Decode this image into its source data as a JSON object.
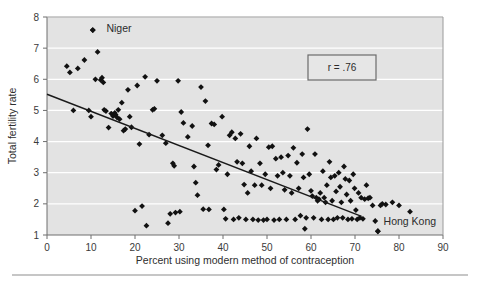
{
  "chart_data": {
    "type": "scatter",
    "title": "",
    "xlabel": "Percent using modern method of contraception",
    "ylabel": "Total fertility rate",
    "xlim": [
      0,
      90
    ],
    "ylim": [
      1,
      8
    ],
    "xticks": [
      "0",
      "10",
      "20",
      "30",
      "40",
      "50",
      "60",
      "70",
      "80",
      "90"
    ],
    "yticks": [
      "1",
      "2",
      "3",
      "4",
      "5",
      "6",
      "7",
      "8"
    ],
    "grid": true,
    "grid_color": "#ffffff",
    "plot_background": "#e3e3e3",
    "marker": "diamond",
    "marker_color": "#111111",
    "annotations": [
      {
        "name": "correlation-box",
        "text": "r = .76",
        "x": 52.5,
        "y": 6.45
      }
    ],
    "point_labels": [
      {
        "name": "niger-label",
        "text": "Niger",
        "x": 13.5,
        "y": 7.52
      },
      {
        "name": "hong-kong-label",
        "text": "Hong Kong",
        "x": 76.5,
        "y": 1.32
      }
    ],
    "trendline": {
      "name": "regression-line",
      "x0": 0,
      "y0": 5.52,
      "x1": 71.5,
      "y1": 1.6,
      "color": "#1a1a1a"
    },
    "points": [
      [
        4.5,
        6.42
      ],
      [
        5.2,
        6.22
      ],
      [
        6.0,
        5.0
      ],
      [
        7.0,
        6.35
      ],
      [
        8.5,
        6.62
      ],
      [
        9.5,
        5.0
      ],
      [
        10.0,
        4.8
      ],
      [
        10.4,
        7.58
      ],
      [
        11.0,
        6.0
      ],
      [
        11.5,
        6.88
      ],
      [
        12.2,
        5.98
      ],
      [
        12.5,
        6.05
      ],
      [
        12.8,
        5.9
      ],
      [
        13.0,
        5.02
      ],
      [
        13.4,
        4.98
      ],
      [
        14.0,
        4.45
      ],
      [
        14.6,
        4.9
      ],
      [
        15.0,
        4.82
      ],
      [
        15.4,
        4.92
      ],
      [
        15.6,
        4.86
      ],
      [
        15.9,
        4.78
      ],
      [
        16.2,
        5.02
      ],
      [
        16.5,
        4.72
      ],
      [
        17.0,
        5.25
      ],
      [
        17.4,
        4.35
      ],
      [
        17.8,
        4.4
      ],
      [
        18.4,
        5.66
      ],
      [
        18.8,
        4.8
      ],
      [
        19.2,
        4.46
      ],
      [
        20.0,
        1.78
      ],
      [
        20.5,
        5.8
      ],
      [
        21.0,
        3.92
      ],
      [
        21.6,
        1.93
      ],
      [
        22.3,
        6.08
      ],
      [
        22.6,
        1.3
      ],
      [
        23.2,
        4.22
      ],
      [
        24.0,
        5.02
      ],
      [
        24.4,
        5.05
      ],
      [
        25.0,
        5.95
      ],
      [
        26.2,
        4.2
      ],
      [
        27.5,
        1.38
      ],
      [
        28.0,
        1.68
      ],
      [
        28.6,
        3.3
      ],
      [
        28.9,
        3.22
      ],
      [
        29.2,
        1.72
      ],
      [
        29.8,
        5.95
      ],
      [
        30.2,
        1.75
      ],
      [
        31.0,
        4.6
      ],
      [
        32.0,
        4.15
      ],
      [
        33.0,
        4.5
      ],
      [
        33.4,
        3.2
      ],
      [
        33.8,
        2.68
      ],
      [
        34.2,
        2.28
      ],
      [
        35.0,
        5.75
      ],
      [
        35.5,
        1.83
      ],
      [
        36.0,
        5.3
      ],
      [
        36.6,
        3.88
      ],
      [
        37.4,
        4.58
      ],
      [
        38.0,
        4.55
      ],
      [
        38.5,
        3.1
      ],
      [
        39.0,
        3.25
      ],
      [
        39.8,
        4.8
      ],
      [
        40.2,
        1.82
      ],
      [
        40.6,
        1.52
      ],
      [
        41.0,
        2.95
      ],
      [
        41.5,
        4.2
      ],
      [
        42.0,
        4.3
      ],
      [
        42.4,
        1.5
      ],
      [
        42.8,
        4.1
      ],
      [
        43.2,
        3.35
      ],
      [
        43.6,
        1.55
      ],
      [
        44.0,
        4.25
      ],
      [
        44.4,
        3.3
      ],
      [
        44.8,
        2.62
      ],
      [
        45.2,
        1.5
      ],
      [
        45.6,
        2.35
      ],
      [
        46.0,
        3.85
      ],
      [
        46.4,
        3.05
      ],
      [
        46.8,
        1.5
      ],
      [
        47.2,
        2.6
      ],
      [
        47.6,
        4.1
      ],
      [
        48.0,
        1.48
      ],
      [
        48.4,
        3.3
      ],
      [
        48.8,
        2.6
      ],
      [
        49.2,
        1.48
      ],
      [
        49.6,
        2.95
      ],
      [
        50.0,
        1.5
      ],
      [
        50.4,
        3.82
      ],
      [
        50.8,
        2.5
      ],
      [
        51.2,
        3.85
      ],
      [
        51.6,
        1.48
      ],
      [
        52.0,
        3.45
      ],
      [
        52.4,
        2.9
      ],
      [
        52.8,
        1.5
      ],
      [
        53.2,
        3.5
      ],
      [
        53.6,
        3.0
      ],
      [
        54.0,
        2.45
      ],
      [
        54.4,
        1.5
      ],
      [
        54.8,
        3.55
      ],
      [
        55.2,
        2.9
      ],
      [
        55.6,
        2.35
      ],
      [
        56.0,
        3.8
      ],
      [
        56.4,
        1.5
      ],
      [
        56.8,
        3.32
      ],
      [
        57.2,
        2.5
      ],
      [
        57.6,
        1.62
      ],
      [
        58.0,
        3.6
      ],
      [
        58.3,
        2.85
      ],
      [
        58.6,
        1.2
      ],
      [
        58.9,
        1.55
      ],
      [
        59.2,
        4.4
      ],
      [
        59.6,
        2.95
      ],
      [
        60.0,
        2.42
      ],
      [
        60.3,
        2.25
      ],
      [
        60.6,
        1.55
      ],
      [
        60.9,
        3.6
      ],
      [
        61.2,
        2.2
      ],
      [
        61.5,
        2.1
      ],
      [
        61.8,
        2.15
      ],
      [
        62.1,
        2.35
      ],
      [
        62.4,
        1.5
      ],
      [
        62.7,
        3.05
      ],
      [
        63.0,
        2.2
      ],
      [
        63.3,
        2.05
      ],
      [
        63.6,
        2.6
      ],
      [
        63.9,
        1.5
      ],
      [
        64.2,
        3.35
      ],
      [
        64.5,
        2.85
      ],
      [
        64.8,
        2.1
      ],
      [
        65.1,
        1.5
      ],
      [
        65.4,
        2.9
      ],
      [
        65.7,
        2.4
      ],
      [
        66.0,
        1.55
      ],
      [
        66.3,
        3.0
      ],
      [
        66.6,
        2.55
      ],
      [
        66.9,
        2.05
      ],
      [
        67.2,
        1.55
      ],
      [
        67.5,
        3.2
      ],
      [
        67.8,
        2.8
      ],
      [
        68.1,
        2.3
      ],
      [
        68.4,
        1.5
      ],
      [
        68.7,
        2.75
      ],
      [
        69.0,
        2.1
      ],
      [
        69.3,
        1.52
      ],
      [
        69.6,
        2.95
      ],
      [
        69.9,
        2.5
      ],
      [
        70.2,
        1.8
      ],
      [
        70.5,
        1.5
      ],
      [
        70.8,
        2.35
      ],
      [
        71.1,
        1.55
      ],
      [
        71.4,
        2.2
      ],
      [
        71.8,
        1.52
      ],
      [
        72.2,
        2.15
      ],
      [
        72.6,
        2.6
      ],
      [
        73.0,
        2.18
      ],
      [
        73.4,
        2.2
      ],
      [
        74.0,
        1.95
      ],
      [
        74.6,
        1.45
      ],
      [
        75.2,
        1.12
      ],
      [
        75.8,
        1.95
      ],
      [
        76.2,
        2.0
      ],
      [
        77.0,
        1.98
      ],
      [
        78.5,
        2.05
      ],
      [
        80.0,
        1.95
      ],
      [
        82.5,
        1.75
      ],
      [
        36.8,
        1.82
      ],
      [
        30.5,
        4.95
      ],
      [
        27.0,
        3.95
      ]
    ]
  }
}
